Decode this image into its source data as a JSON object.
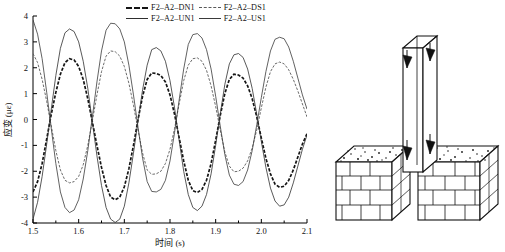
{
  "chart_data": {
    "type": "line",
    "title": "",
    "xlabel": "时间 (s)",
    "ylabel": "应变 (με)",
    "xlim": [
      1.5,
      2.1
    ],
    "ylim": [
      -4,
      4
    ],
    "grid": false,
    "legend_position": "top-center",
    "xticks": [
      "1.5",
      "1.6",
      "1.7",
      "1.8",
      "1.9",
      "2.0",
      "2.1"
    ],
    "xtick_values": [
      1.5,
      1.6,
      1.7,
      1.8,
      1.9,
      2.0,
      2.1
    ],
    "yticks": [
      "4",
      "3",
      "2",
      "1",
      "0",
      "-1",
      "-2",
      "-3",
      "-4"
    ],
    "ytick_values": [
      4,
      3,
      2,
      1,
      0,
      -1,
      -2,
      -3,
      -4
    ],
    "x": [
      1.5,
      1.51,
      1.52,
      1.53,
      1.54,
      1.55,
      1.56,
      1.57,
      1.58,
      1.59,
      1.6,
      1.61,
      1.62,
      1.63,
      1.64,
      1.65,
      1.66,
      1.67,
      1.68,
      1.69,
      1.7,
      1.71,
      1.72,
      1.73,
      1.74,
      1.75,
      1.76,
      1.77,
      1.78,
      1.79,
      1.8,
      1.81,
      1.82,
      1.83,
      1.84,
      1.85,
      1.86,
      1.87,
      1.88,
      1.89,
      1.9,
      1.91,
      1.92,
      1.93,
      1.94,
      1.95,
      1.96,
      1.97,
      1.98,
      1.99,
      2.0,
      2.01,
      2.02,
      2.03,
      2.04,
      2.05,
      2.06,
      2.07,
      2.08,
      2.09,
      2.1
    ],
    "series": [
      {
        "name": "F2-A2-DN1",
        "style": "thick-dashed",
        "amplitude": 2.4,
        "values": [
          -2.8,
          -2.4,
          -1.7,
          -0.75,
          0.2,
          1.05,
          1.75,
          2.2,
          2.35,
          2.3,
          2.05,
          1.55,
          0.8,
          -0.1,
          -1.0,
          -1.85,
          -2.55,
          -3.0,
          -3.1,
          -3.0,
          -2.6,
          -1.9,
          -1.0,
          0.0,
          0.9,
          1.55,
          1.8,
          1.78,
          1.7,
          1.45,
          0.95,
          0.2,
          -0.7,
          -1.6,
          -2.35,
          -2.75,
          -2.82,
          -2.7,
          -2.35,
          -1.7,
          -0.8,
          0.15,
          1.0,
          1.55,
          1.75,
          1.72,
          1.6,
          1.3,
          0.8,
          0.1,
          -0.72,
          -1.5,
          -2.1,
          -2.5,
          -2.62,
          -2.58,
          -2.35,
          -1.95,
          -1.45,
          -0.95,
          -0.55
        ]
      },
      {
        "name": "F2-A2-DS1",
        "style": "thin-dashed",
        "amplitude": 2.6,
        "values": [
          2.55,
          2.2,
          1.55,
          0.7,
          -0.25,
          -1.2,
          -1.95,
          -2.35,
          -2.45,
          -2.4,
          -2.2,
          -1.75,
          -1.0,
          -0.05,
          0.95,
          1.85,
          2.45,
          2.65,
          2.62,
          2.45,
          2.05,
          1.4,
          0.55,
          -0.4,
          -1.3,
          -1.95,
          -2.12,
          -2.1,
          -2.0,
          -1.7,
          -1.15,
          -0.35,
          0.6,
          1.5,
          2.1,
          2.35,
          2.38,
          2.25,
          1.9,
          1.3,
          0.5,
          -0.4,
          -1.25,
          -1.8,
          -2.02,
          -2.0,
          -1.88,
          -1.6,
          -1.1,
          -0.4,
          0.45,
          1.25,
          1.85,
          2.15,
          2.22,
          2.15,
          1.92,
          1.55,
          1.1,
          0.6,
          0.1
        ]
      },
      {
        "name": "F2-A2-UN1",
        "style": "solid",
        "amplitude": 3.7,
        "values": [
          -3.85,
          -3.2,
          -2.2,
          -0.95,
          0.4,
          1.7,
          2.75,
          3.35,
          3.5,
          3.4,
          3.0,
          2.25,
          1.2,
          -0.1,
          -1.4,
          -2.55,
          -3.4,
          -3.85,
          -3.98,
          -3.85,
          -3.35,
          -2.45,
          -1.3,
          -0.05,
          1.15,
          2.1,
          2.7,
          2.78,
          2.65,
          2.25,
          1.5,
          0.45,
          -0.8,
          -2.0,
          -2.9,
          -3.4,
          -3.52,
          -3.35,
          -2.9,
          -2.1,
          -1.0,
          0.2,
          1.35,
          2.15,
          2.5,
          2.55,
          2.4,
          1.95,
          1.2,
          0.2,
          -0.85,
          -1.85,
          -2.65,
          -3.15,
          -3.35,
          -3.3,
          -3.0,
          -2.45,
          -1.8,
          -1.15,
          -0.6
        ]
      },
      {
        "name": "F2-A2-US1",
        "style": "solid",
        "amplitude": 3.8,
        "values": [
          3.85,
          3.3,
          2.35,
          1.05,
          -0.35,
          -1.7,
          -2.8,
          -3.4,
          -3.6,
          -3.5,
          -3.1,
          -2.3,
          -1.2,
          0.1,
          1.45,
          2.65,
          3.45,
          3.72,
          3.7,
          3.5,
          3.0,
          2.1,
          0.95,
          -0.3,
          -1.5,
          -2.4,
          -2.78,
          -2.8,
          -2.7,
          -2.35,
          -1.6,
          -0.5,
          0.75,
          1.95,
          2.9,
          3.28,
          3.32,
          3.15,
          2.7,
          1.95,
          0.9,
          -0.25,
          -1.35,
          -2.15,
          -2.5,
          -2.55,
          -2.4,
          -1.95,
          -1.2,
          -0.2,
          0.85,
          1.85,
          2.65,
          3.1,
          3.18,
          3.12,
          2.8,
          2.25,
          1.6,
          0.95,
          0.4
        ]
      }
    ]
  },
  "legend": {
    "rows": [
      [
        {
          "label": "F2–A2–DN1",
          "swatch": "thick-dashed-line"
        },
        {
          "label": "F2–A2–DS1",
          "swatch": "thin-dashed-line"
        }
      ],
      [
        {
          "label": "F2–A2–UN1",
          "swatch": "solid-line"
        },
        {
          "label": "F2–A2–US1",
          "swatch": "solid-line"
        }
      ]
    ]
  },
  "diagram": {
    "name": "column-on-masonry-foundation",
    "parts": [
      "column-3d-box",
      "sensor-arrow-top-left",
      "sensor-arrow-top-right",
      "sensor-arrow-base-left",
      "sensor-arrow-base-right",
      "foundation-left-block",
      "foundation-right-block",
      "gravel-top-surface",
      "brick-pattern-front"
    ]
  },
  "colors": {
    "line_primary": "#151515",
    "line_secondary": "#5a5a5a",
    "axis": "#000000",
    "background": "#ffffff"
  }
}
